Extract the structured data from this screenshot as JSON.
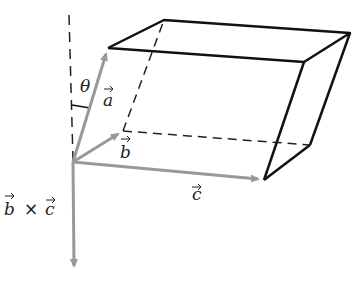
{
  "figure": {
    "labels": {
      "theta": "θ",
      "a": "a",
      "b": "b",
      "c": "c",
      "cross_b": "b",
      "cross_times": "×",
      "cross_c": "c"
    },
    "colors": {
      "edge": "#111111",
      "vector": "#999999",
      "dashed": "#222222",
      "text": "#222222"
    },
    "vertices": {
      "origin": [
        73,
        162
      ],
      "a_tip": [
        108,
        48
      ],
      "b_tip": [
        123,
        131
      ],
      "c_tip": [
        264,
        180
      ],
      "top_back_left": [
        164,
        20
      ],
      "top_front_right": [
        304,
        62
      ],
      "top_back_right": [
        350,
        33
      ],
      "bottom_back_right": [
        310,
        145
      ],
      "normal_tip": [
        74,
        272
      ]
    }
  }
}
